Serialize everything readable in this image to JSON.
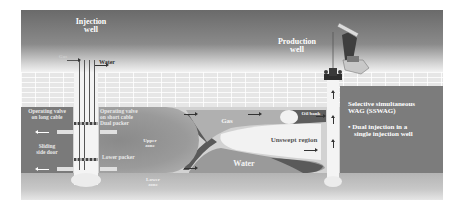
{
  "diagram": {
    "title": "Selective simultaneous WAG (SSWAG)",
    "injection_well": {
      "label_line1": "Injection",
      "label_line2": "well",
      "gas_inlet": "Gas",
      "water_inlet": "Water"
    },
    "production_well": {
      "label_line1": "Production",
      "label_line2": "well"
    },
    "left_panel": {
      "valve_long_line1": "Operating valve",
      "valve_long_line2": "on long cable",
      "sliding_line1": "Sliding",
      "sliding_line2": "side door"
    },
    "mid_panel": {
      "valve_short_line1": "Operating valve",
      "valve_short_line2": "on short cable",
      "dual_packer": "Dual packer",
      "lower_packer": "Lower packer",
      "upper_zone_line1": "Upper",
      "upper_zone_line2": "zone",
      "lower_zone_line1": "Lower",
      "lower_zone_line2": "zone"
    },
    "reservoir": {
      "gas_label": "Gas",
      "water_label": "Water",
      "oil_bank_label": "Oil bank",
      "unswept_label": "Unswept region"
    },
    "info_box": {
      "heading_line1": "Selective simultaneous",
      "heading_line2": "WAG (SSWAG)",
      "bullet_line1": "Dual injection in a",
      "bullet_line2": "single injection well"
    },
    "colors": {
      "sky_dark": "#6a6a6a",
      "panel": "#7a7a7a",
      "reservoir": "#d2d2d2",
      "gas_zone": "#b0b0b0",
      "water_zone": "#9a9a9a",
      "well_bore": "#f4f4f4"
    }
  }
}
